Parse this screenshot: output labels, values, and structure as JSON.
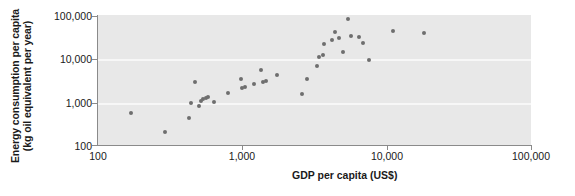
{
  "chart_data": {
    "type": "scatter",
    "title": "",
    "xlabel": "GDP per capita (US$)",
    "ylabel_line1": "Energy consumption per capita",
    "ylabel_line2": "(kg oil equivalent per year)",
    "xscale": "log",
    "yscale": "log",
    "xlim": [
      100,
      100000
    ],
    "ylim": [
      100,
      100000
    ],
    "xticks": [
      100,
      1000,
      10000,
      100000
    ],
    "xtick_labels": [
      "100",
      "1,000",
      "10,000",
      "100,000"
    ],
    "yticks": [
      100,
      1000,
      10000,
      100000
    ],
    "ytick_labels": [
      "100",
      "1,000",
      "10,000",
      "100,000"
    ],
    "grid": "horizontal-white-gridlines-at-1000-and-10000",
    "legend": "none",
    "marker_color": "#6e6e6e",
    "plot_background": "#e8e8e8",
    "axis_color": "#8a8a8a",
    "points": [
      {
        "x": 170,
        "y": 540
      },
      {
        "x": 290,
        "y": 200
      },
      {
        "x": 430,
        "y": 430
      },
      {
        "x": 440,
        "y": 950
      },
      {
        "x": 500,
        "y": 800
      },
      {
        "x": 520,
        "y": 1050
      },
      {
        "x": 530,
        "y": 1150
      },
      {
        "x": 560,
        "y": 1200
      },
      {
        "x": 580,
        "y": 1250
      },
      {
        "x": 640,
        "y": 1000
      },
      {
        "x": 470,
        "y": 2800
      },
      {
        "x": 800,
        "y": 1600
      },
      {
        "x": 980,
        "y": 3300
      },
      {
        "x": 1000,
        "y": 2100
      },
      {
        "x": 1050,
        "y": 2150
      },
      {
        "x": 1200,
        "y": 2600
      },
      {
        "x": 1400,
        "y": 2900
      },
      {
        "x": 1450,
        "y": 2950
      },
      {
        "x": 1350,
        "y": 5300
      },
      {
        "x": 1750,
        "y": 4200
      },
      {
        "x": 2600,
        "y": 1500
      },
      {
        "x": 2800,
        "y": 3300
      },
      {
        "x": 3300,
        "y": 6500
      },
      {
        "x": 3400,
        "y": 10500
      },
      {
        "x": 3600,
        "y": 12000
      },
      {
        "x": 3700,
        "y": 21000
      },
      {
        "x": 4200,
        "y": 26000
      },
      {
        "x": 4400,
        "y": 40000
      },
      {
        "x": 4700,
        "y": 30000
      },
      {
        "x": 5000,
        "y": 14000
      },
      {
        "x": 5400,
        "y": 80000
      },
      {
        "x": 5700,
        "y": 32000
      },
      {
        "x": 6400,
        "y": 31000
      },
      {
        "x": 6900,
        "y": 22000
      },
      {
        "x": 7600,
        "y": 9000
      },
      {
        "x": 11000,
        "y": 42000
      },
      {
        "x": 18000,
        "y": 39000
      }
    ]
  }
}
